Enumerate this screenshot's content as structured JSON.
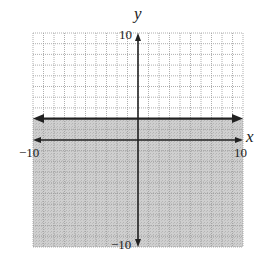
{
  "chart_data": {
    "type": "line",
    "title": "",
    "inequality": "y <= 2",
    "boundary": {
      "equation": "y = 2",
      "style": "solid",
      "slope": 0,
      "intercept": 2
    },
    "shaded_region": "below",
    "xlabel": "x",
    "ylabel": "y",
    "xlim": [
      -10,
      10
    ],
    "ylim": [
      -10,
      10
    ],
    "grid": true,
    "grid_step": 1,
    "tick_labels": {
      "x_min": "−10",
      "x_max": "10",
      "y_max": "10",
      "y_min": "−10"
    },
    "colors": {
      "shade": "#c8c8c8",
      "grid": "#9a9a9a",
      "axis": "#222222",
      "line": "#222222"
    }
  }
}
